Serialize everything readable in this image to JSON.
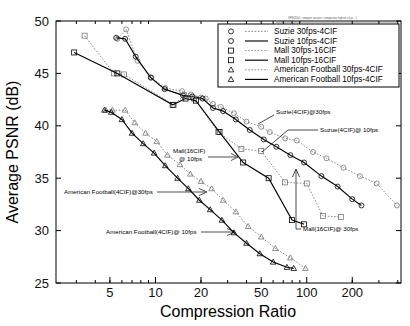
{
  "figure": {
    "header_note": "SPIE2004 : compare session r comparison highres v1.ps : 1",
    "background": "#ffffff"
  },
  "chart_data": {
    "type": "line",
    "title": "",
    "xlabel": "Compression Ratio",
    "ylabel": "Average PSNR (dB)",
    "xscale": "log",
    "yscale": "linear",
    "xlim": [
      2.2,
      420
    ],
    "ylim": [
      25,
      50
    ],
    "xticks": [
      5,
      10,
      20,
      50,
      100,
      200
    ],
    "xticklabels": [
      "5",
      "10",
      "20",
      "50",
      "100",
      "200"
    ],
    "yticks": [
      25,
      30,
      35,
      40,
      45,
      50
    ],
    "yticklabels": [
      "25",
      "30",
      "35",
      "40",
      "45",
      "50"
    ],
    "grid": false,
    "legend_position": "upper right",
    "series": [
      {
        "name": "Suzie 30fps-4CIF",
        "marker": "circle",
        "linestyle": "dotted",
        "color": "#777777",
        "points": [
          [
            5.6,
            48.3
          ],
          [
            6.4,
            49.2
          ],
          [
            7.6,
            46.2
          ],
          [
            9.4,
            44.6
          ],
          [
            11.6,
            43.6
          ],
          [
            15.0,
            43.3
          ],
          [
            17.2,
            43.0
          ],
          [
            20.0,
            42.7
          ],
          [
            21.5,
            42.6
          ],
          [
            24.0,
            42.1
          ],
          [
            27.0,
            41.8
          ],
          [
            33.0,
            41.2
          ],
          [
            40.0,
            40.4
          ],
          [
            50.0,
            39.9
          ],
          [
            57.0,
            39.4
          ],
          [
            72.0,
            38.8
          ],
          [
            86.0,
            38.6
          ],
          [
            110.0,
            37.5
          ],
          [
            135.0,
            36.9
          ],
          [
            175.0,
            36.0
          ],
          [
            225.0,
            35.2
          ],
          [
            290.0,
            34.5
          ],
          [
            395.0,
            32.4
          ]
        ]
      },
      {
        "name": "Suzie 10fps-4CIF",
        "marker": "circle",
        "linestyle": "solid",
        "color": "#000000",
        "points": [
          [
            5.5,
            48.4
          ],
          [
            6.3,
            48.3
          ],
          [
            7.4,
            46.6
          ],
          [
            9.3,
            44.6
          ],
          [
            11.5,
            43.5
          ],
          [
            15.2,
            42.9
          ],
          [
            17.5,
            42.8
          ],
          [
            20.5,
            42.6
          ],
          [
            24.0,
            41.7
          ],
          [
            28.0,
            41.4
          ],
          [
            34.0,
            40.6
          ],
          [
            42.0,
            39.6
          ],
          [
            52.0,
            38.7
          ],
          [
            63.0,
            38.0
          ],
          [
            78.0,
            37.2
          ],
          [
            96.0,
            36.5
          ],
          [
            125.0,
            35.2
          ],
          [
            160.0,
            34.2
          ],
          [
            200.0,
            33.0
          ],
          [
            230.0,
            32.4
          ]
        ]
      },
      {
        "name": "Mall 30fps-16CIF",
        "marker": "square",
        "linestyle": "dotted",
        "color": "#777777",
        "points": [
          [
            3.4,
            48.6
          ],
          [
            5.3,
            45.0
          ],
          [
            6.2,
            44.9
          ],
          [
            13.2,
            42.0
          ],
          [
            15.5,
            42.9
          ],
          [
            18.0,
            42.6
          ],
          [
            26.0,
            39.4
          ],
          [
            37.0,
            37.8
          ],
          [
            50.0,
            37.6
          ],
          [
            72.0,
            34.6
          ],
          [
            100.0,
            34.5
          ],
          [
            128.0,
            31.4
          ],
          [
            168.0,
            31.3
          ]
        ]
      },
      {
        "name": "Mall 10fps-16CIF",
        "marker": "square",
        "linestyle": "solid",
        "color": "#000000",
        "points": [
          [
            2.9,
            47.0
          ],
          [
            5.6,
            45.0
          ],
          [
            13.0,
            42.0
          ],
          [
            15.8,
            42.6
          ],
          [
            18.5,
            42.4
          ],
          [
            26.5,
            39.4
          ],
          [
            38.0,
            36.5
          ],
          [
            56.0,
            35.0
          ],
          [
            80.0,
            31.0
          ],
          [
            96.0,
            30.6
          ]
        ]
      },
      {
        "name": "American Football 30fps-4CIF",
        "marker": "triangle",
        "linestyle": "dotted",
        "color": "#777777",
        "points": [
          [
            4.7,
            41.5
          ],
          [
            5.2,
            41.5
          ],
          [
            6.3,
            41.5
          ],
          [
            7.3,
            40.3
          ],
          [
            8.6,
            39.3
          ],
          [
            10.2,
            38.5
          ],
          [
            12.0,
            37.2
          ],
          [
            14.5,
            36.3
          ],
          [
            17.0,
            35.4
          ],
          [
            20.0,
            34.7
          ],
          [
            23.5,
            34.0
          ],
          [
            28.0,
            32.9
          ],
          [
            34.0,
            31.8
          ],
          [
            41.0,
            30.4
          ],
          [
            50.0,
            29.4
          ],
          [
            62.0,
            28.3
          ],
          [
            78.0,
            27.4
          ],
          [
            98.0,
            26.4
          ]
        ]
      },
      {
        "name": "American Football 10fps-4CIF",
        "marker": "triangle",
        "linestyle": "solid",
        "color": "#000000",
        "points": [
          [
            4.6,
            41.5
          ],
          [
            5.1,
            41.3
          ],
          [
            6.0,
            40.6
          ],
          [
            7.0,
            39.3
          ],
          [
            8.3,
            38.3
          ],
          [
            9.8,
            37.4
          ],
          [
            11.6,
            36.2
          ],
          [
            14.0,
            35.0
          ],
          [
            16.5,
            34.0
          ],
          [
            19.5,
            32.9
          ],
          [
            23.0,
            32.0
          ],
          [
            27.5,
            31.0
          ],
          [
            33.0,
            29.8
          ],
          [
            40.0,
            28.8
          ],
          [
            49.0,
            27.8
          ],
          [
            60.0,
            27.0
          ],
          [
            74.0,
            26.5
          ],
          [
            82.0,
            26.4
          ]
        ]
      }
    ],
    "annotations": [
      {
        "id": "suzie-30fps",
        "text": "Suzie(4CIF)@30fps"
      },
      {
        "id": "suzue-10fps",
        "text": "Suzue(4CIF)@ 10fps"
      },
      {
        "id": "mall-10fps-line1",
        "text": "Mall(16CIF)"
      },
      {
        "id": "mall-10fps-line2",
        "text": "@ 10fps"
      },
      {
        "id": "mall-30fps",
        "text": "Mall(16CIF)@ 30fps"
      },
      {
        "id": "af-30fps",
        "text": "American Football(4CIF)@30fps"
      },
      {
        "id": "af-10fps",
        "text": "American Football(4CIF)@ 10fps"
      }
    ]
  },
  "legend": {
    "items": [
      {
        "label": "Suzie 30fps-4CIF",
        "marker": "circle",
        "linestyle": "dotted"
      },
      {
        "label": "Suzie 10fps-4CIF",
        "marker": "circle",
        "linestyle": "solid"
      },
      {
        "label": "Mall 30fps-16CIF",
        "marker": "square",
        "linestyle": "dotted"
      },
      {
        "label": "Mall 10fps-16CIF",
        "marker": "square",
        "linestyle": "solid"
      },
      {
        "label": "American Football 30fps-4CIF",
        "marker": "triangle",
        "linestyle": "dotted"
      },
      {
        "label": "American Football 10fps-4CIF",
        "marker": "triangle",
        "linestyle": "solid"
      }
    ]
  }
}
